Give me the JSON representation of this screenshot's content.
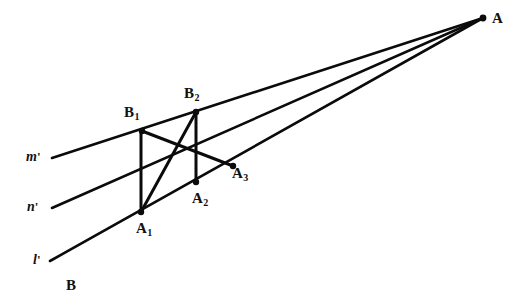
{
  "figure": {
    "type": "geometric-construction-diagram",
    "background_color": "#ffffff",
    "stroke_color": "#0b0b0b",
    "width": 513,
    "height": 306
  },
  "points": {
    "A": {
      "label": "A",
      "sub": "",
      "x": 483,
      "y": 18,
      "label_x": 492,
      "label_y": 11
    },
    "B": {
      "label": "B",
      "sub": "",
      "x": 72,
      "y": 285,
      "label_x": 66,
      "label_y": 278
    },
    "B1": {
      "label": "B",
      "sub": "1",
      "x": 142,
      "y": 131,
      "label_x": 124,
      "label_y": 105
    },
    "B2": {
      "label": "B",
      "sub": "2",
      "x": 196,
      "y": 112,
      "label_x": 184,
      "label_y": 86
    },
    "A1": {
      "label": "A",
      "sub": "1",
      "x": 141,
      "y": 212,
      "label_x": 136,
      "label_y": 221
    },
    "A2": {
      "label": "A",
      "sub": "2",
      "x": 196,
      "y": 182,
      "label_x": 192,
      "label_y": 191
    },
    "A3": {
      "label": "A",
      "sub": "3",
      "x": 233,
      "y": 166,
      "label_x": 232,
      "label_y": 166
    }
  },
  "rays": {
    "m": {
      "label": "m",
      "prime": "'",
      "label_x": 26,
      "label_y": 150,
      "x1": 52,
      "y1": 158,
      "x2": 483,
      "y2": 18
    },
    "n": {
      "label": "n",
      "prime": "'",
      "label_x": 27,
      "label_y": 200,
      "x1": 52,
      "y1": 208,
      "x2": 483,
      "y2": 18
    },
    "l": {
      "label": "l",
      "prime": "'",
      "label_x": 33,
      "label_y": 253,
      "x1": 50,
      "y1": 261,
      "x2": 483,
      "y2": 18
    }
  },
  "segments": {
    "vertical_1": {
      "name": "B1-A1",
      "x1": 141,
      "y1": 131,
      "x2": 141,
      "y2": 212
    },
    "vertical_2": {
      "name": "B2-A2",
      "x1": 196,
      "y1": 112,
      "x2": 196,
      "y2": 182
    },
    "cross_1": {
      "name": "B1-A3",
      "x1": 142,
      "y1": 131,
      "x2": 233,
      "y2": 166
    },
    "cross_2": {
      "name": "A1-B2",
      "x1": 141,
      "y1": 212,
      "x2": 196,
      "y2": 112
    }
  },
  "intersection": {
    "name": "cross-point",
    "x": 196,
    "y": 147
  }
}
